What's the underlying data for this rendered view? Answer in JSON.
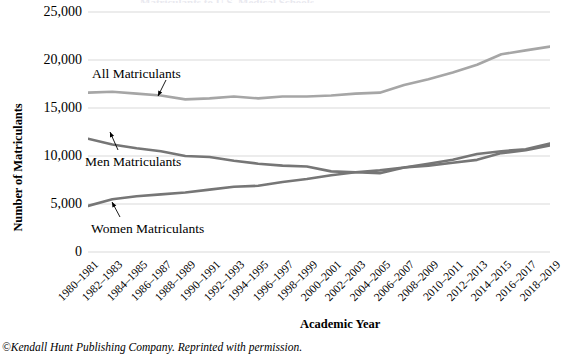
{
  "figure": {
    "y_axis_title": "Number of Matriculants",
    "x_axis_title": "Academic Year",
    "credit": "©Kendall Hunt Publishing Company. Reprinted with permission.",
    "title_clipped": "Matriculants to U.S. Medical Schools"
  },
  "annotations": {
    "all": "All Matriculants",
    "men": "Men Matriculants",
    "women": "Women Matriculants"
  },
  "colors": {
    "all_line": "#a6a6a6",
    "men_line": "#767676",
    "women_line": "#767676",
    "gridline": "#d9d9d9",
    "text": "#000000"
  },
  "chart_data": {
    "type": "line",
    "title": "Matriculants to U.S. Medical Schools",
    "xlabel": "Academic Year",
    "ylabel": "Number of Matriculants",
    "ylim": [
      0,
      25000
    ],
    "yticks": [
      0,
      5000,
      10000,
      15000,
      20000,
      25000
    ],
    "ytick_labels": [
      "0",
      "5,000",
      "10,000",
      "15,000",
      "20,000",
      "25,000"
    ],
    "grid": true,
    "legend_position": "inline-annotations",
    "categories": [
      "1980–1981",
      "1982–1983",
      "1984–1985",
      "1986–1987",
      "1988–1989",
      "1990–1991",
      "1992–1993",
      "1994–1995",
      "1996–1997",
      "1998–1999",
      "2000–2001",
      "2002–2003",
      "2004–2005",
      "2006–2007",
      "2008–2009",
      "2010–2011",
      "2012–2013",
      "2014–2015",
      "2016–2017",
      "2018–2019"
    ],
    "series": [
      {
        "name": "All Matriculants",
        "color": "#a6a6a6",
        "values": [
          16600,
          16700,
          16500,
          16300,
          15900,
          16000,
          16200,
          16000,
          16200,
          16200,
          16300,
          16500,
          16600,
          17400,
          18000,
          18700,
          19500,
          20600,
          21000,
          21400
        ]
      },
      {
        "name": "Men Matriculants",
        "color": "#767676",
        "values": [
          11800,
          11200,
          10800,
          10500,
          10000,
          9900,
          9500,
          9200,
          9000,
          8900,
          8400,
          8300,
          8200,
          8800,
          9000,
          9300,
          9600,
          10300,
          10600,
          11100
        ]
      },
      {
        "name": "Women Matriculants",
        "color": "#767676",
        "values": [
          4800,
          5500,
          5800,
          6000,
          6200,
          6500,
          6800,
          6900,
          7300,
          7600,
          8000,
          8300,
          8500,
          8800,
          9200,
          9600,
          10200,
          10500,
          10700,
          11300
        ]
      }
    ]
  }
}
